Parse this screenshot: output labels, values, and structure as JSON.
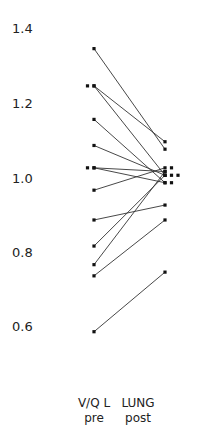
{
  "chart_data": {
    "type": "line",
    "subtype": "paired-slope",
    "title": "",
    "xlabel": "",
    "ylabel": "",
    "categories": [
      "V/Q L\npre",
      "LUNG\npost"
    ],
    "category_labels": [
      {
        "line1": "V/Q L",
        "line2": "pre"
      },
      {
        "line1": "LUNG",
        "line2": "post"
      }
    ],
    "yticks": [
      "1.4",
      "1.2",
      "1.0",
      "0.8",
      "0.6"
    ],
    "ytick_values": [
      1.4,
      1.2,
      1.0,
      0.8,
      0.6
    ],
    "ylim": [
      0.55,
      1.45
    ],
    "grid": false,
    "legend": null,
    "pairs": [
      {
        "pre": 1.35,
        "post": 1.08
      },
      {
        "pre": 1.25,
        "post": 1.1
      },
      {
        "pre": 1.25,
        "post": 1.01
      },
      {
        "pre": 1.16,
        "post": 0.99
      },
      {
        "pre": 1.09,
        "post": 1.01
      },
      {
        "pre": 1.03,
        "post": 1.02
      },
      {
        "pre": 1.03,
        "post": 0.99
      },
      {
        "pre": 0.97,
        "post": 1.03
      },
      {
        "pre": 0.89,
        "post": 0.93
      },
      {
        "pre": 0.82,
        "post": 1.01
      },
      {
        "pre": 0.77,
        "post": 1.02
      },
      {
        "pre": 0.74,
        "post": 0.89
      },
      {
        "pre": 0.59,
        "post": 0.75
      }
    ],
    "extra_points": [
      {
        "group": "pre",
        "value": 1.25,
        "offset": -1
      },
      {
        "group": "pre",
        "value": 1.03,
        "offset": -1
      },
      {
        "group": "post",
        "value": 1.03,
        "offset": 1
      },
      {
        "group": "post",
        "value": 1.01,
        "offset": 1
      },
      {
        "group": "post",
        "value": 1.01,
        "offset": 2
      },
      {
        "group": "post",
        "value": 0.99,
        "offset": 1
      }
    ]
  },
  "style": {
    "line_color": "#333333",
    "point_color": "#111111"
  }
}
